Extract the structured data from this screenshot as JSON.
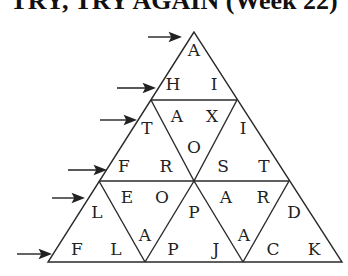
{
  "title": "TRY, TRY AGAIN (Week 22)",
  "puzzle": {
    "type": "triangle-word-grid",
    "rows": [
      {
        "row": 1,
        "arrow": true
      },
      {
        "row": 2,
        "arrow": true
      },
      {
        "row": 3,
        "arrow": true
      },
      {
        "row": 4,
        "arrow": true
      },
      {
        "row": 5,
        "arrow": true
      },
      {
        "row": 6,
        "arrow": true
      }
    ],
    "letters": [
      {
        "ch": "A",
        "x": 194,
        "y": 50
      },
      {
        "ch": "H",
        "x": 173,
        "y": 84
      },
      {
        "ch": "I",
        "x": 214,
        "y": 84
      },
      {
        "ch": "A",
        "x": 177,
        "y": 116
      },
      {
        "ch": "X",
        "x": 212,
        "y": 116
      },
      {
        "ch": "T",
        "x": 147,
        "y": 128
      },
      {
        "ch": "I",
        "x": 243,
        "y": 128
      },
      {
        "ch": "O",
        "x": 194,
        "y": 147
      },
      {
        "ch": "F",
        "x": 124,
        "y": 166
      },
      {
        "ch": "R",
        "x": 166,
        "y": 166
      },
      {
        "ch": "S",
        "x": 223,
        "y": 166
      },
      {
        "ch": "T",
        "x": 264,
        "y": 166
      },
      {
        "ch": "E",
        "x": 127,
        "y": 197
      },
      {
        "ch": "O",
        "x": 162,
        "y": 197
      },
      {
        "ch": "A",
        "x": 226,
        "y": 197
      },
      {
        "ch": "R",
        "x": 263,
        "y": 197
      },
      {
        "ch": "L",
        "x": 97,
        "y": 212
      },
      {
        "ch": "P",
        "x": 194,
        "y": 212
      },
      {
        "ch": "D",
        "x": 294,
        "y": 212
      },
      {
        "ch": "A",
        "x": 145,
        "y": 235
      },
      {
        "ch": "A",
        "x": 244,
        "y": 235
      },
      {
        "ch": "F",
        "x": 77,
        "y": 249
      },
      {
        "ch": "L",
        "x": 116,
        "y": 249
      },
      {
        "ch": "P",
        "x": 173,
        "y": 249
      },
      {
        "ch": "J",
        "x": 216,
        "y": 249
      },
      {
        "ch": "C",
        "x": 273,
        "y": 249
      },
      {
        "ch": "K",
        "x": 314,
        "y": 249
      }
    ]
  }
}
